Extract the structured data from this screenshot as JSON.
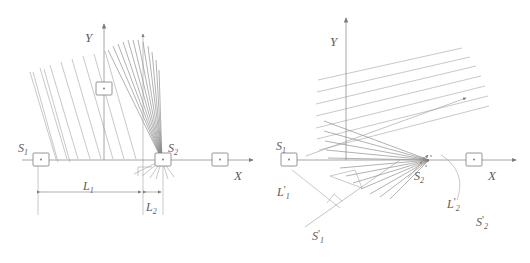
{
  "figure": {
    "panels": [
      {
        "id": "left",
        "name": "unrotated-configuration",
        "axes": {
          "x_label": "X",
          "y_label": "Y"
        },
        "sources": [
          {
            "key": "s1",
            "label": "S",
            "sub": "1"
          },
          {
            "key": "s2",
            "label": "S",
            "sub": "2"
          }
        ],
        "dimensions": [
          {
            "key": "l1",
            "label": "L",
            "sub": "1"
          },
          {
            "key": "l2",
            "label": "L",
            "sub": "2"
          }
        ]
      },
      {
        "id": "right",
        "name": "rotated-configuration",
        "axes": {
          "x_label": "X",
          "y_label": "Y"
        },
        "sources": [
          {
            "key": "s1",
            "label": "S",
            "sub": "1",
            "prime": ""
          },
          {
            "key": "s2",
            "label": "S",
            "sub": "2",
            "prime": ""
          },
          {
            "key": "s1p",
            "label": "S",
            "sub": "1",
            "prime": "'"
          },
          {
            "key": "s2p",
            "label": "S",
            "sub": "2",
            "prime": "'"
          }
        ],
        "dimensions": [
          {
            "key": "l1p",
            "label": "L",
            "sub": "1",
            "prime": "'"
          },
          {
            "key": "l2p",
            "label": "L",
            "sub": "2",
            "prime": "'"
          }
        ]
      }
    ]
  },
  "labels": {
    "left_y_axis": "Y",
    "left_x_axis": "X",
    "left_s1_base": "S",
    "left_s1_sub": "1",
    "left_s2_base": "S",
    "left_s2_sub": "2",
    "left_l1_base": "L",
    "left_l1_sub": "1",
    "left_l2_base": "L",
    "left_l2_sub": "2",
    "right_y_axis": "Y",
    "right_x_axis": "X",
    "right_s1_base": "S",
    "right_s1_sub": "1",
    "right_s2_base": "S",
    "right_s2_sub": "2",
    "right_s1p_base": "S",
    "right_s1p_prime": "'",
    "right_s1p_sub": "1",
    "right_s2p_base": "S",
    "right_s2p_prime": "'",
    "right_s2p_sub": "2",
    "right_l1p_base": "L",
    "right_l1p_prime": "'",
    "right_l1p_sub": "1",
    "right_l2p_base": "L",
    "right_l2p_prime": "'",
    "right_l2p_sub": "2"
  },
  "colors": {
    "ink": "#5d5d5d",
    "ray": "#9a9a9a",
    "axis": "#8a8a8a",
    "background": "#ffffff"
  }
}
